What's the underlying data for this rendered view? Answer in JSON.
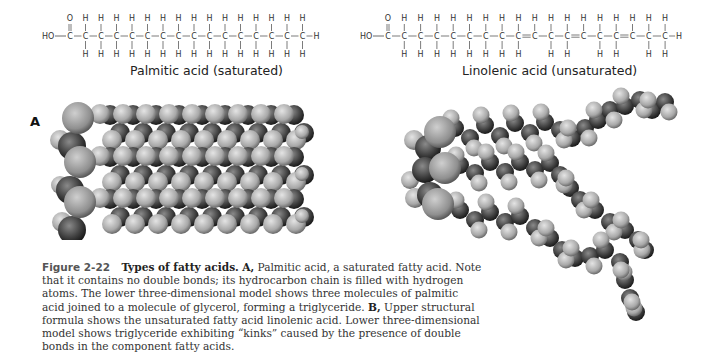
{
  "structures": [
    {
      "name": "Palmitic acid (saturated)",
      "head": "HO",
      "carbon_count": 16,
      "double_bonds_after_carbon": [],
      "top_h": "H",
      "bottom_h": "H",
      "carbonyl_o": "O",
      "terminal": "H"
    },
    {
      "name": "Linolenic acid (unsaturated)",
      "head": "HO",
      "carbon_count": 18,
      "double_bonds_after_carbon": [
        9,
        12,
        15
      ],
      "top_h": "H",
      "bottom_h": "H",
      "carbonyl_o": "O",
      "terminal": "H"
    }
  ],
  "panels": {
    "a_label": "A",
    "b_label": "B"
  },
  "caption": {
    "figure_number": "Figure 2-22",
    "title": "Types of fatty acids.",
    "a_marker": "A,",
    "a_text": "Palmitic acid, a saturated fatty acid. Note that it contains no double bonds; its hydrocarbon chain is filled with hydrogen atoms. The lower three-dimensional model shows three molecules of palmitic acid joined to a molecule of glycerol, forming a triglyceride.",
    "b_marker": "B,",
    "b_text": "Upper structural formula shows the unsaturated fatty acid linolenic acid. Lower three-dimensional model shows triglyceride exhibiting “kinks” caused by the presence of double bonds in the component fatty acids."
  },
  "colors": {
    "carbon": "#3a3a3a",
    "hydrogen": "#b8b8b8",
    "oxygen": "#9a9a9a",
    "text": "#333333"
  }
}
